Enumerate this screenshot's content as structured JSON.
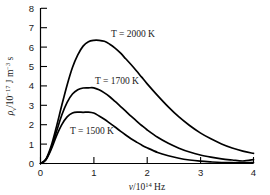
{
  "chart_data": {
    "type": "line",
    "title": "",
    "subtitle": "",
    "xlabel": "v/10^14 Hz",
    "xlabel_parts": {
      "symbol": "ν",
      "slash": "/10",
      "exponent": "14",
      "unit": " Hz"
    },
    "ylabel": "ρv/10^-17 J m^-3 s",
    "ylabel_parts": {
      "symbol": "ρ",
      "subscript": "ν",
      "slash": "/10",
      "exponent": "−17",
      "unit": " J m",
      "unit_exponent": "−3",
      "unit_tail": " s"
    },
    "xlim": [
      0,
      4
    ],
    "ylim": [
      0,
      8
    ],
    "xticks": [
      0,
      1,
      2,
      3,
      4
    ],
    "xtick_labels": [
      "0",
      "1",
      "2",
      "3",
      "4"
    ],
    "yticks": [
      0,
      1,
      2,
      3,
      4,
      5,
      6,
      7,
      8
    ],
    "ytick_labels": [
      "0",
      "1",
      "2",
      "3",
      "4",
      "5",
      "6",
      "7",
      "8"
    ],
    "grid": false,
    "legend_position": "inline-annotations",
    "tick_direction": "in",
    "line_color": "#000000",
    "background_color": "#ffffff",
    "x": [
      0.1,
      0.2,
      0.3,
      0.4,
      0.5,
      0.6,
      0.7,
      0.8,
      0.9,
      1.0,
      1.1,
      1.2,
      1.3,
      1.4,
      1.5,
      1.6,
      1.7,
      1.8,
      1.9,
      2.0,
      2.2,
      2.4,
      2.6,
      2.8,
      3.0,
      3.2,
      3.4,
      3.6,
      3.8,
      4.0
    ],
    "series": [
      {
        "name": "T = 2000 K",
        "temperature_K": 2000,
        "label": "T = 2000 K",
        "peak_x": 1.15,
        "peak_y": 6.35,
        "values": [
          0.22,
          0.9,
          1.9,
          3.0,
          4.05,
          4.95,
          5.6,
          6.05,
          6.28,
          6.35,
          6.35,
          6.3,
          6.15,
          5.95,
          5.7,
          5.4,
          5.1,
          4.78,
          4.45,
          4.12,
          3.5,
          2.92,
          2.4,
          1.96,
          1.58,
          1.27,
          1.01,
          0.8,
          0.64,
          0.52
        ]
      },
      {
        "name": "T = 1700 K",
        "temperature_K": 1700,
        "label": "T = 1700 K",
        "peak_x": 1.0,
        "peak_y": 3.9,
        "values": [
          0.2,
          0.8,
          1.65,
          2.5,
          3.15,
          3.58,
          3.8,
          3.89,
          3.9,
          3.9,
          3.8,
          3.64,
          3.44,
          3.2,
          2.95,
          2.7,
          2.44,
          2.2,
          1.96,
          1.74,
          1.35,
          1.04,
          0.79,
          0.59,
          0.44,
          0.33,
          0.24,
          0.18,
          0.13,
          0.2
        ]
      },
      {
        "name": "T = 1500 K",
        "temperature_K": 1500,
        "label": "T = 1500 K",
        "peak_x": 0.9,
        "peak_y": 2.65,
        "values": [
          0.18,
          0.72,
          1.42,
          2.0,
          2.4,
          2.6,
          2.65,
          2.64,
          2.65,
          2.6,
          2.45,
          2.28,
          2.08,
          1.88,
          1.67,
          1.47,
          1.28,
          1.11,
          0.95,
          0.81,
          0.57,
          0.4,
          0.27,
          0.18,
          0.12,
          0.08,
          0.05,
          0.04,
          0.03,
          0.05
        ]
      }
    ],
    "annotations": [
      {
        "text": "T = 2000 K",
        "x": 1.35,
        "y": 7.15
      },
      {
        "text": "T = 1700 K",
        "x": 1.2,
        "y": 4.7
      },
      {
        "text": "T = 1500 K",
        "x": 0.95,
        "y": 1.95
      }
    ]
  }
}
